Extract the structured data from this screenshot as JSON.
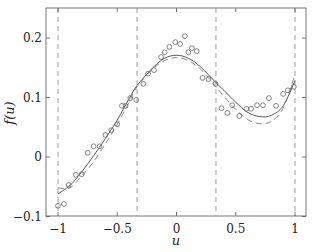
{
  "chart_data": {
    "type": "scatter",
    "title": "",
    "xlabel": "u",
    "ylabel": "f(u)",
    "xlim": [
      -1.1,
      1.1
    ],
    "ylim": [
      -0.1,
      0.25
    ],
    "grid": false,
    "legend": null,
    "x_ticks": [
      -1,
      -0.5,
      0,
      0.5,
      1
    ],
    "x_tick_labels": [
      "−1",
      "−0.5",
      "0",
      "0.5",
      "1"
    ],
    "y_ticks": [
      -0.1,
      0,
      0.1,
      0.2
    ],
    "y_tick_labels": [
      "−0.1",
      "0",
      "0.1",
      "0.2"
    ],
    "vertical_dashed_lines": [
      -1,
      -0.333,
      0.333,
      1
    ],
    "series": [
      {
        "name": "noisy samples",
        "style": "circle-markers",
        "x": [
          -1.0,
          -0.95,
          -0.91,
          -0.85,
          -0.8,
          -0.75,
          -0.7,
          -0.65,
          -0.6,
          -0.55,
          -0.5,
          -0.46,
          -0.43,
          -0.39,
          -0.34,
          -0.28,
          -0.24,
          -0.19,
          -0.13,
          -0.1,
          -0.06,
          -0.01,
          0.03,
          0.07,
          0.1,
          0.13,
          0.17,
          0.22,
          0.27,
          0.33,
          0.38,
          0.43,
          0.47,
          0.53,
          0.59,
          0.63,
          0.68,
          0.73,
          0.78,
          0.84,
          0.9,
          0.94,
          0.99
        ],
        "y": [
          -0.082,
          -0.079,
          -0.047,
          -0.03,
          -0.029,
          0.007,
          0.018,
          0.018,
          0.037,
          0.045,
          0.055,
          0.086,
          0.086,
          0.099,
          0.096,
          0.123,
          0.14,
          0.146,
          0.168,
          0.176,
          0.185,
          0.193,
          0.19,
          0.203,
          0.176,
          0.183,
          0.178,
          0.133,
          0.131,
          0.123,
          0.082,
          0.074,
          0.087,
          0.069,
          0.081,
          0.081,
          0.087,
          0.087,
          0.099,
          0.086,
          0.106,
          0.112,
          0.118
        ]
      },
      {
        "name": "fit (solid)",
        "style": "solid-line",
        "x": [
          -1.0,
          -0.9,
          -0.8,
          -0.7,
          -0.6,
          -0.5,
          -0.4,
          -0.333,
          -0.2,
          -0.1,
          0.0,
          0.1,
          0.2,
          0.333,
          0.4,
          0.5,
          0.6,
          0.7,
          0.8,
          0.9,
          1.0
        ],
        "y": [
          -0.062,
          -0.048,
          -0.025,
          0.002,
          0.031,
          0.062,
          0.098,
          0.12,
          0.15,
          0.166,
          0.171,
          0.166,
          0.152,
          0.125,
          0.112,
          0.092,
          0.075,
          0.068,
          0.07,
          0.086,
          0.128
        ]
      },
      {
        "name": "fit (dashed)",
        "style": "dashed-line",
        "x": [
          -1.0,
          -0.9,
          -0.8,
          -0.7,
          -0.6,
          -0.5,
          -0.4,
          -0.333,
          -0.2,
          -0.1,
          0.0,
          0.1,
          0.2,
          0.333,
          0.4,
          0.5,
          0.6,
          0.7,
          0.8,
          0.9,
          1.0
        ],
        "y": [
          -0.052,
          -0.052,
          -0.032,
          -0.008,
          0.022,
          0.055,
          0.092,
          0.118,
          0.148,
          0.162,
          0.167,
          0.162,
          0.148,
          0.118,
          0.102,
          0.08,
          0.063,
          0.056,
          0.06,
          0.082,
          0.138
        ]
      }
    ]
  }
}
